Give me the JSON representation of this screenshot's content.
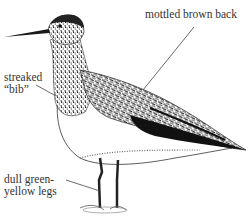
{
  "figure": {
    "colors": {
      "ink": "#111111",
      "background": "#ffffff",
      "label": "#333333"
    }
  },
  "labels": {
    "back": {
      "line1": "mottled brown back"
    },
    "bib": {
      "line1": "streaked",
      "line2": "“bib”"
    },
    "legs": {
      "line1": "dull green-",
      "line2": "yellow legs"
    }
  }
}
